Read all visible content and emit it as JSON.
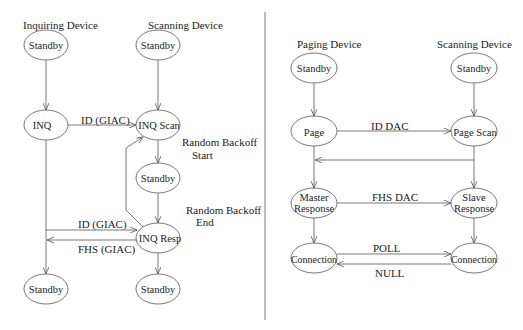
{
  "left_diagram": {
    "headers": {
      "inquiring": "Inquiring Device",
      "scanning": "Scanning Device"
    },
    "nodes": {
      "inq_standby_top": "Standby",
      "scan_standby_top": "Standby",
      "inq": "INQ",
      "inq_scan": "INQ Scan",
      "scan_standby_mid": "Standby",
      "inq_resp": "INQ Resp",
      "inq_standby_bottom": "Standby",
      "scan_standby_bottom": "Standby"
    },
    "edges": {
      "id_giac_1": "ID (GIAC)",
      "id_giac_2": "ID (GIAC)",
      "fhs_giac": "FHS (GIAC)"
    },
    "annotations": {
      "backoff_start_1": "Random Backoff",
      "backoff_start_2": "Start",
      "backoff_end_1": "Random Backoff",
      "backoff_end_2": "End"
    }
  },
  "right_diagram": {
    "headers": {
      "paging": "Paging Device",
      "scanning": "Scanning Device"
    },
    "nodes": {
      "page_standby": "Standby",
      "scan_standby": "Standby",
      "page": "Page",
      "page_scan": "Page Scan",
      "master_1": "Master",
      "master_2": "Response",
      "slave_1": "Slave",
      "slave_2": "Response",
      "conn_left": "Connection",
      "conn_right": "Connection"
    },
    "edges": {
      "id_dac": "ID DAC",
      "fhs_dac": "FHS DAC",
      "poll": "POLL",
      "null": "NULL"
    }
  }
}
